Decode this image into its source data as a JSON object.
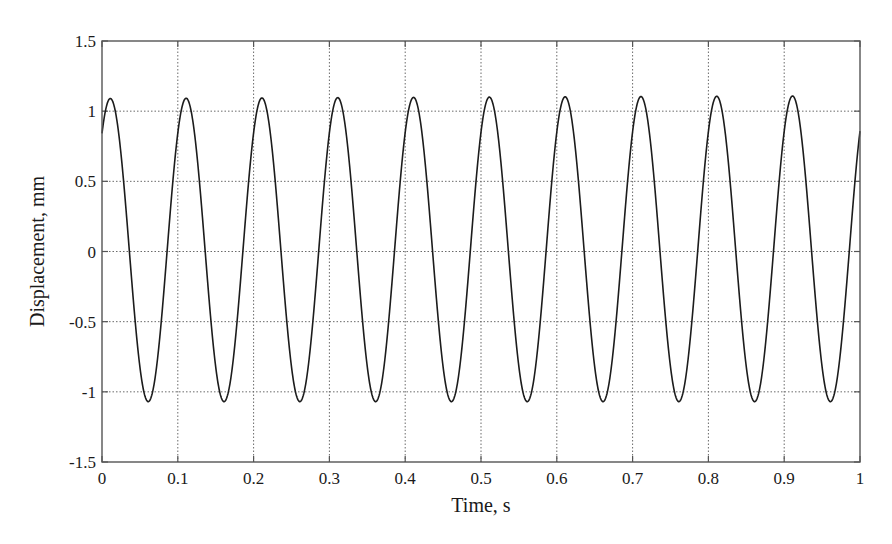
{
  "chart_data": {
    "type": "line",
    "title": "",
    "xlabel": "Time, s",
    "ylabel": "Displacement, mm",
    "xlim": [
      0,
      1
    ],
    "ylim": [
      -1.5,
      1.5
    ],
    "grid": true,
    "legend": "none",
    "xticks": [
      0,
      0.1,
      0.2,
      0.3,
      0.4,
      0.5,
      0.6,
      0.7,
      0.8,
      0.9,
      1
    ],
    "xtick_labels": [
      "0",
      "0.1",
      "0.2",
      "0.3",
      "0.4",
      "0.5",
      "0.6",
      "0.7",
      "0.8",
      "0.9",
      "1"
    ],
    "yticks": [
      1.5,
      1,
      0.5,
      0,
      -0.5,
      -1,
      -1.5
    ],
    "ytick_labels": [
      "1.5",
      "1",
      "0.5",
      "0",
      "-0.5",
      "-1",
      "-1.5"
    ],
    "series": [
      {
        "name": "displacement",
        "description": "sinusoid, frequency 10 Hz (period 0.1 s), amplitude ~1.08 mm, mean ~0.01 mm, starts at ~0.8 mm",
        "frequency_hz": 10,
        "amplitude": 1.08,
        "offset": 0.01,
        "phase_rad": 0.88,
        "color": "#1c1c1c",
        "peaks": [
          {
            "t": 0.012,
            "y": 1.07
          },
          {
            "t": 0.112,
            "y": 1.08
          },
          {
            "t": 0.212,
            "y": 1.08
          },
          {
            "t": 0.312,
            "y": 1.08
          },
          {
            "t": 0.412,
            "y": 1.09
          },
          {
            "t": 0.512,
            "y": 1.09
          },
          {
            "t": 0.612,
            "y": 1.09
          },
          {
            "t": 0.712,
            "y": 1.09
          },
          {
            "t": 0.812,
            "y": 1.1
          },
          {
            "t": 0.912,
            "y": 1.1
          }
        ],
        "troughs": [
          {
            "t": 0.062,
            "y": -1.07
          },
          {
            "t": 0.162,
            "y": -1.07
          },
          {
            "t": 0.262,
            "y": -1.07
          },
          {
            "t": 0.362,
            "y": -1.07
          },
          {
            "t": 0.462,
            "y": -1.07
          },
          {
            "t": 0.562,
            "y": -1.07
          },
          {
            "t": 0.662,
            "y": -1.07
          },
          {
            "t": 0.762,
            "y": -1.07
          },
          {
            "t": 0.862,
            "y": -1.07
          },
          {
            "t": 0.962,
            "y": -1.07
          }
        ],
        "start": {
          "t": 0,
          "y": 0.82
        },
        "end": {
          "t": 1,
          "y": 0.78
        }
      }
    ]
  }
}
